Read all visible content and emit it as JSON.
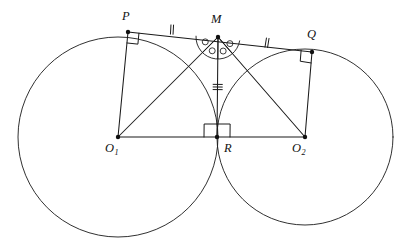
{
  "figure": {
    "canvas": {
      "width": 398,
      "height": 252,
      "background": "#ffffff"
    },
    "stroke_color": "#1a1a1a",
    "label_color": "#111111"
  },
  "labels": {
    "P": "P",
    "Q": "Q",
    "M": "M",
    "R": "R",
    "O1_base": "O",
    "O1_sub": "1",
    "O2_base": "O",
    "O2_sub": "2"
  },
  "points": {
    "P": {
      "x": 128,
      "y": 32,
      "label": "P",
      "label_x": 122,
      "label_y": 10
    },
    "Q": {
      "x": 312,
      "y": 52,
      "label": "Q",
      "label_x": 307,
      "label_y": 28
    },
    "M": {
      "x": 218,
      "y": 37,
      "label": "M",
      "label_x": 211,
      "label_y": 13
    },
    "R": {
      "x": 217,
      "y": 137,
      "label": "R",
      "label_x": 224,
      "label_y": 142
    },
    "O1": {
      "x": 118,
      "y": 137,
      "label": "O1",
      "label_x": 105,
      "label_y": 142
    },
    "O2": {
      "x": 305,
      "y": 137,
      "label": "O2",
      "label_x": 292,
      "label_y": 142
    }
  },
  "circles": [
    {
      "name": "left-circle",
      "cx": 118,
      "cy": 137,
      "r": 100
    },
    {
      "name": "right-circle",
      "cx": 305,
      "cy": 137,
      "r": 88
    }
  ],
  "segments": [
    {
      "name": "tangent-line-PQ",
      "from": "P",
      "to": "Q"
    },
    {
      "name": "radius-O1-P",
      "from": "O1",
      "to": "P"
    },
    {
      "name": "radius-O2-Q",
      "from": "O2",
      "to": "Q"
    },
    {
      "name": "center-line-O1-O2",
      "from": "O1",
      "to": "O2"
    },
    {
      "name": "segment-O1-M",
      "from": "O1",
      "to": "M"
    },
    {
      "name": "segment-O2-M",
      "from": "O2",
      "to": "M"
    },
    {
      "name": "segment-M-R",
      "from": "M",
      "to": "R"
    }
  ],
  "right_angles": [
    {
      "name": "right-angle-at-P",
      "at": "P",
      "size": 11
    },
    {
      "name": "right-angle-at-Q",
      "at": "Q",
      "size": 11
    },
    {
      "name": "right-angle-at-R",
      "at": "R",
      "size": 13
    }
  ],
  "tick_marks": [
    {
      "name": "tick-PM",
      "on": "P-M",
      "count": 2,
      "x": 172,
      "y": 29.6,
      "orientation": "perpendicular"
    },
    {
      "name": "tick-MQ",
      "on": "M-Q",
      "count": 2,
      "x": 267,
      "y": 42.8,
      "orientation": "perpendicular"
    },
    {
      "name": "tick-MR",
      "on": "M-R",
      "count": 3,
      "x": 217.7,
      "y": 87,
      "orientation": "perpendicular"
    }
  ],
  "angle_markers": {
    "name": "congruent-angles-at-M",
    "vertex": "M",
    "arc_radius": 22,
    "dot_radius": 3.0,
    "count": 4,
    "description": "Four equal marked angles at vertex M inside a semicircular arc"
  },
  "notes": {
    "tangency": "Circles are externally tangent at R",
    "midpoint": "M is the midpoint of tangent segment PQ",
    "perpendicular": "O1P and O2Q are perpendicular to PQ; MR is perpendicular to O1O2"
  }
}
